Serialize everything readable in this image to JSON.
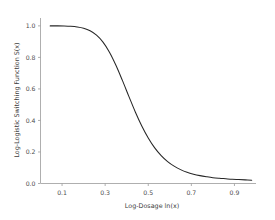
{
  "chart_data": {
    "type": "line",
    "title": "",
    "xlabel": "Log-Dosage ln(x)",
    "ylabel": "Log-Logistic Switching Function S(x)",
    "xlim": [
      0.0,
      1.0
    ],
    "ylim": [
      0.0,
      1.05
    ],
    "grid": false,
    "legend": null,
    "xticks": [
      "0.1",
      "0.3",
      "0.5",
      "0.7",
      "0.9"
    ],
    "xtick_values": [
      0.1,
      0.3,
      0.5,
      0.7,
      0.9
    ],
    "yticks": [
      "0.0",
      "0.2",
      "0.4",
      "0.6",
      "0.8",
      "1.0"
    ],
    "ytick_values": [
      0.0,
      0.2,
      0.4,
      0.6,
      0.8,
      1.0
    ],
    "series": [
      {
        "name": "S(x)",
        "color": "#262626",
        "x": [
          0.045,
          0.08,
          0.11,
          0.14,
          0.17,
          0.2,
          0.23,
          0.26,
          0.29,
          0.32,
          0.35,
          0.38,
          0.41,
          0.44,
          0.47,
          0.5,
          0.53,
          0.56,
          0.59,
          0.62,
          0.65,
          0.68,
          0.71,
          0.74,
          0.77,
          0.8,
          0.83,
          0.86,
          0.89,
          0.92,
          0.95,
          0.98
        ],
        "y": [
          1.0,
          1.0,
          0.999,
          0.997,
          0.993,
          0.985,
          0.969,
          0.941,
          0.897,
          0.833,
          0.75,
          0.654,
          0.553,
          0.454,
          0.365,
          0.289,
          0.226,
          0.177,
          0.139,
          0.11,
          0.088,
          0.071,
          0.059,
          0.05,
          0.043,
          0.037,
          0.033,
          0.03,
          0.027,
          0.025,
          0.023,
          0.021
        ]
      }
    ]
  },
  "axes": {
    "x_title": "Log-Dosage ln(x)",
    "y_title": "Log-Logistic Switching Function S(x)"
  },
  "ticks": {
    "x": [
      {
        "label": "0.1",
        "value": 0.1
      },
      {
        "label": "0.3",
        "value": 0.3
      },
      {
        "label": "0.5",
        "value": 0.5
      },
      {
        "label": "0.7",
        "value": 0.7
      },
      {
        "label": "0.9",
        "value": 0.9
      }
    ],
    "y": [
      {
        "label": "0.0",
        "value": 0.0
      },
      {
        "label": "0.2",
        "value": 0.2
      },
      {
        "label": "0.4",
        "value": 0.4
      },
      {
        "label": "0.6",
        "value": 0.6
      },
      {
        "label": "0.8",
        "value": 0.8
      },
      {
        "label": "1.0",
        "value": 1.0
      }
    ]
  },
  "colors": {
    "curve": "#262626",
    "axis": "#9a9a9a",
    "text": "#4d4d4d",
    "background": "#ffffff"
  }
}
